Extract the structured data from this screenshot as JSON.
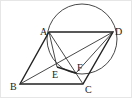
{
  "diagram": {
    "type": "geometry",
    "points": {
      "A": {
        "label": "A",
        "x": 49,
        "y": 32
      },
      "B": {
        "label": "B",
        "x": 20,
        "y": 84
      },
      "C": {
        "label": "C",
        "x": 83,
        "y": 84
      },
      "D": {
        "label": "D",
        "x": 113,
        "y": 32
      },
      "E": {
        "label": "E",
        "x": 57,
        "y": 67
      },
      "F": {
        "label": "F",
        "x": 76,
        "y": 73
      }
    },
    "circle": {
      "cx": 82,
      "cy": 39,
      "r": 35
    },
    "stroke_color": "#222222"
  }
}
